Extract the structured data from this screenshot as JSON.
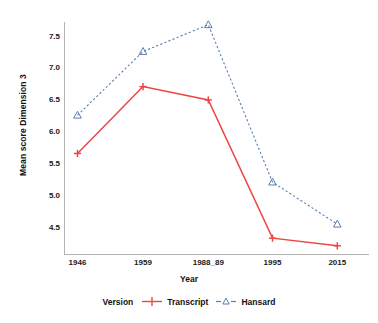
{
  "chart_data": {
    "type": "line",
    "title": "",
    "xlabel": "Year",
    "ylabel": "Mean score Dimension 3",
    "categories": [
      "1946",
      "1959",
      "1988_89",
      "1995",
      "2015"
    ],
    "series": [
      {
        "name": "Transcript",
        "color": "#ef4444",
        "linestyle": "solid",
        "marker": "plus",
        "values": [
          5.65,
          6.7,
          6.49,
          4.32,
          4.2
        ]
      },
      {
        "name": "Hansard",
        "color": "#5b7fae",
        "linestyle": "dashed",
        "marker": "triangle-open",
        "values": [
          6.25,
          7.25,
          7.67,
          5.2,
          4.54
        ]
      }
    ],
    "ylim": [
      4.2,
      7.8
    ],
    "yticks": [
      4.5,
      5.0,
      5.5,
      6.0,
      6.5,
      7.0,
      7.5
    ],
    "ytick_labels": [
      "4.5",
      "5.0",
      "5.5",
      "6.0",
      "6.5",
      "7.0",
      "7.5"
    ],
    "grid": false,
    "legend": {
      "title": "Version",
      "position": "bottom",
      "entries": [
        "Transcript",
        "Hansard"
      ]
    }
  },
  "colors": {
    "transcript": "#ef4444",
    "hansard": "#5b7fae",
    "axis": "#b4b4b4",
    "text": "#1a1a1a",
    "background": "#ffffff"
  }
}
